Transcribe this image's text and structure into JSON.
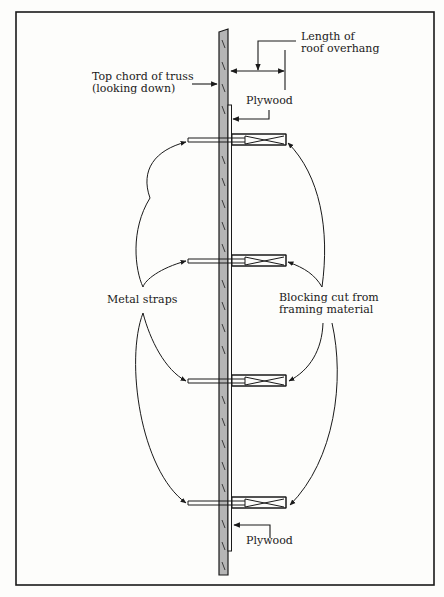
{
  "diagram": {
    "labels": {
      "overhang_line1": "Length of",
      "overhang_line2": "roof overhang",
      "chord_line1": "Top chord of truss",
      "chord_line2": "(looking down)",
      "plywood_top": "Plywood",
      "metal_straps": "Metal straps",
      "blocking_line1": "Blocking cut from",
      "blocking_line2": "framing material",
      "plywood_bottom": "Plywood"
    },
    "colors": {
      "ink": "#1a1a1a",
      "chord_fill": "#b5b5b5",
      "paper": "#fdfdfb"
    },
    "blocks_y": [
      140,
      261,
      381,
      503
    ]
  }
}
